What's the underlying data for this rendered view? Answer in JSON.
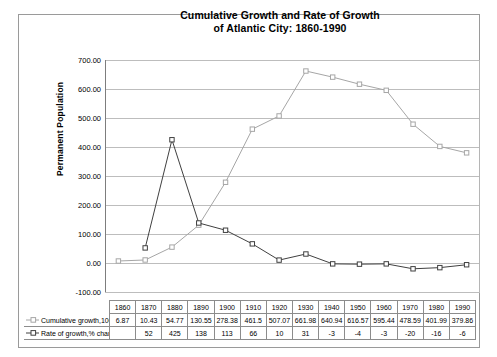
{
  "chart_data": {
    "type": "line",
    "title": "Cumulative Growth and Rate of Growth of Atlantic City: 1860-1990",
    "title_line1": "Cumulative Growth and Rate of Growth",
    "title_line2": "of Atlantic City: 1860-1990",
    "xlabel": "",
    "ylabel": "Permanent Population",
    "ylim": [
      -100,
      700
    ],
    "ytick_labels": [
      "700.00",
      "600.00",
      "500.00",
      "400.00",
      "300.00",
      "200.00",
      "100.00",
      "0.00",
      "-100.00"
    ],
    "ytick_values": [
      700,
      600,
      500,
      400,
      300,
      200,
      100,
      0,
      -100
    ],
    "grid": true,
    "legend_position": "table",
    "categories": [
      "1860",
      "1870",
      "1880",
      "1890",
      "1900",
      "1910",
      "1920",
      "1930",
      "1940",
      "1950",
      "1960",
      "1970",
      "1980",
      "1990"
    ],
    "series": [
      {
        "name": "Cumulative growth,100s",
        "color": "#a6a6a6",
        "marker": "square",
        "values": [
          6.87,
          10.43,
          54.77,
          130.55,
          278.38,
          461.5,
          507.07,
          661.98,
          640.94,
          616.57,
          595.44,
          478.59,
          401.99,
          379.86
        ],
        "value_labels": [
          "6.87",
          "10.43",
          "54.77",
          "130.55",
          "278.38",
          "461.5",
          "507.07",
          "661.98",
          "640.94",
          "616.57",
          "595.44",
          "478.59",
          "401.99",
          "379.86"
        ]
      },
      {
        "name": "Rate of growth,% change",
        "color": "#404040",
        "marker": "square",
        "values": [
          null,
          52,
          425,
          138,
          113,
          66,
          10,
          31,
          -3,
          -4,
          -3,
          -20,
          -16,
          -6
        ],
        "value_labels": [
          "",
          "52",
          "425",
          "138",
          "113",
          "66",
          "10",
          "31",
          "-3",
          "-4",
          "-3",
          "-20",
          "-16",
          "-6"
        ]
      }
    ]
  },
  "table": {
    "row_labels": [
      "Cumulative growth,100s",
      "Rate of growth,% change"
    ]
  }
}
